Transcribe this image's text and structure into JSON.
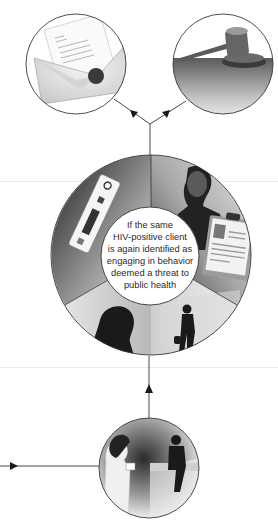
{
  "diagram": {
    "type": "flow",
    "nodes": [
      {
        "id": "notification",
        "depiction": "envelope-letter-with-seal",
        "position": "top-left"
      },
      {
        "id": "court",
        "depiction": "judge-gavel",
        "position": "top-right"
      },
      {
        "id": "central",
        "depiction": "segmented-circle",
        "segments": [
          {
            "depiction": "hiv-test-kit",
            "position": "upper-left"
          },
          {
            "depiction": "man-with-id-clipboard",
            "position": "upper-right"
          },
          {
            "depiction": "woman-silhouette",
            "position": "lower-left"
          },
          {
            "depiction": "person-walking-with-bag",
            "position": "lower-right"
          }
        ]
      },
      {
        "id": "counseling",
        "depiction": "counselor-with-client",
        "position": "bottom"
      }
    ],
    "center_text": {
      "lines": [
        "If the same",
        "HIV-positive client",
        "is again identified as",
        "engaging in behavior",
        "deemed a threat to",
        "public health"
      ]
    },
    "edges": [
      {
        "from": "incoming-left",
        "to": "counseling",
        "arrow": "right"
      },
      {
        "from": "counseling",
        "to": "central",
        "arrow": "up"
      },
      {
        "from": "central",
        "to": "notification",
        "arrow": "up-left"
      },
      {
        "from": "central",
        "to": "court",
        "arrow": "up-right"
      }
    ],
    "colors": {
      "line": "#333333",
      "text": "#2a2a2a",
      "background": "#ffffff"
    }
  }
}
